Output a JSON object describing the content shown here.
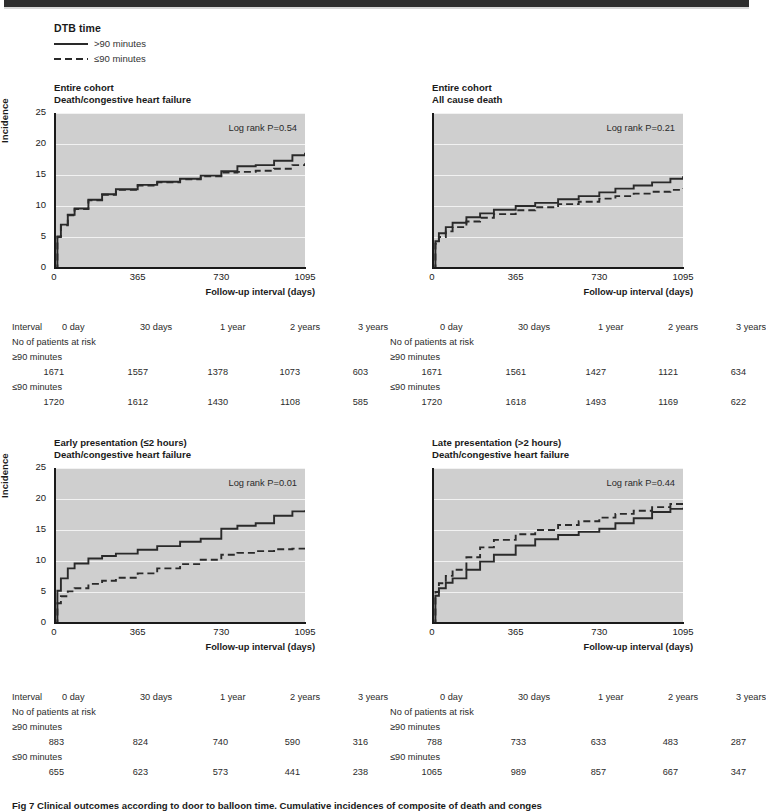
{
  "legend": {
    "title": "DTB time",
    "items": [
      {
        "label": ">90 minutes",
        "style": "solid"
      },
      {
        "label": "≤90 minutes",
        "style": "dashed"
      }
    ]
  },
  "axis": {
    "ylabel": "Incidence",
    "xtitle": "Follow-up interval (days)",
    "yticks": [
      "0",
      "5",
      "10",
      "15",
      "20",
      "25"
    ],
    "xticks": [
      "0",
      "365",
      "730",
      "1095"
    ]
  },
  "risk_table": {
    "interval_label": "Interval",
    "at_risk_label": "No of patients at risk",
    "columns": [
      "0 day",
      "30 days",
      "1 year",
      "2 years",
      "3 years"
    ],
    "group_labels": [
      "≥90 minutes",
      "≤90 minutes"
    ]
  },
  "caption": "Fig 7 Clinical outcomes according to door to balloon time. Cumulative incidences of composite of death and conges",
  "panels": [
    {
      "id": "entire-cohort-death-chf",
      "title_line1": "Entire cohort",
      "title_line2": "Death/congestive heart failure",
      "pvalue": "Log rank P=0.54",
      "show_y_labels": true,
      "rows": [
        {
          "group": "≥90 minutes",
          "values": [
            "1671",
            "1557",
            "1378",
            "1073",
            "603"
          ]
        },
        {
          "group": "≤90 minutes",
          "values": [
            "1720",
            "1612",
            "1430",
            "1108",
            "585"
          ]
        }
      ]
    },
    {
      "id": "entire-cohort-all-cause-death",
      "title_line1": "Entire cohort",
      "title_line2": "All cause death",
      "pvalue": "Log rank P=0.21",
      "show_y_labels": false,
      "rows": [
        {
          "group": "≥90 minutes",
          "values": [
            "1671",
            "1561",
            "1427",
            "1121",
            "634"
          ]
        },
        {
          "group": "≤90 minutes",
          "values": [
            "1720",
            "1618",
            "1493",
            "1169",
            "622"
          ]
        }
      ]
    },
    {
      "id": "early-presentation-death-chf",
      "title_line1": "Early presentation (≤2 hours)",
      "title_line2": "Death/congestive heart failure",
      "pvalue": "Log rank P=0.01",
      "show_y_labels": true,
      "rows": [
        {
          "group": "≥90 minutes",
          "values": [
            "883",
            "824",
            "740",
            "590",
            "316"
          ]
        },
        {
          "group": "≤90 minutes",
          "values": [
            "655",
            "623",
            "573",
            "441",
            "238"
          ]
        }
      ]
    },
    {
      "id": "late-presentation-death-chf",
      "title_line1": "Late presentation (>2 hours)",
      "title_line2": "Death/congestive heart failure",
      "pvalue": "Log rank P=0.44",
      "show_y_labels": false,
      "rows": [
        {
          "group": "≥90 minutes",
          "values": [
            "788",
            "733",
            "633",
            "483",
            "287"
          ]
        },
        {
          "group": "≤90 minutes",
          "values": [
            "1065",
            "989",
            "857",
            "667",
            "347"
          ]
        }
      ]
    }
  ],
  "chart_data": [
    {
      "type": "line",
      "title": "Entire cohort — Death/congestive heart failure",
      "xlabel": "Follow-up interval (days)",
      "ylabel": "Incidence",
      "xlim": [
        0,
        1095
      ],
      "ylim": [
        0,
        25
      ],
      "xticks": [
        0,
        365,
        730,
        1095
      ],
      "yticks": [
        0,
        5,
        10,
        15,
        20,
        25
      ],
      "grid": true,
      "annotation": "Log rank P=0.54",
      "series": [
        {
          "name": ">90 minutes",
          "style": "solid",
          "x": [
            0,
            15,
            30,
            60,
            90,
            150,
            210,
            270,
            365,
            450,
            550,
            640,
            730,
            800,
            880,
            960,
            1040,
            1095
          ],
          "y": [
            0,
            5.1,
            7.0,
            8.6,
            9.6,
            11.0,
            11.9,
            12.7,
            13.4,
            13.9,
            14.4,
            14.9,
            15.6,
            16.4,
            16.6,
            17.3,
            18.2,
            18.6
          ]
        },
        {
          "name": "≤90 minutes",
          "style": "dashed",
          "x": [
            0,
            15,
            30,
            60,
            90,
            150,
            210,
            270,
            365,
            450,
            550,
            640,
            730,
            800,
            880,
            960,
            1040,
            1095
          ],
          "y": [
            0,
            5.0,
            6.9,
            8.5,
            9.5,
            10.9,
            11.8,
            12.6,
            13.3,
            13.8,
            14.3,
            14.8,
            15.4,
            15.5,
            15.7,
            16.0,
            16.6,
            16.9
          ]
        }
      ]
    },
    {
      "type": "line",
      "title": "Entire cohort — All cause death",
      "xlabel": "Follow-up interval (days)",
      "ylabel": "Incidence",
      "xlim": [
        0,
        1095
      ],
      "ylim": [
        0,
        25
      ],
      "xticks": [
        0,
        365,
        730,
        1095
      ],
      "yticks": [
        0,
        5,
        10,
        15,
        20,
        25
      ],
      "grid": true,
      "annotation": "Log rank P=0.21",
      "series": [
        {
          "name": ">90 minutes",
          "style": "solid",
          "x": [
            0,
            15,
            30,
            60,
            90,
            150,
            210,
            270,
            365,
            450,
            550,
            640,
            730,
            800,
            880,
            960,
            1040,
            1095
          ],
          "y": [
            0,
            4.3,
            5.6,
            6.6,
            7.3,
            8.2,
            8.8,
            9.4,
            10.0,
            10.5,
            11.1,
            11.6,
            12.2,
            12.8,
            13.3,
            13.8,
            14.4,
            14.8
          ]
        },
        {
          "name": "≤90 minutes",
          "style": "dashed",
          "x": [
            0,
            15,
            30,
            60,
            90,
            150,
            210,
            270,
            365,
            450,
            550,
            640,
            730,
            800,
            880,
            960,
            1040,
            1095
          ],
          "y": [
            0,
            3.9,
            5.0,
            5.9,
            6.6,
            7.5,
            8.1,
            8.7,
            9.3,
            9.8,
            10.3,
            10.7,
            11.2,
            11.6,
            12.0,
            12.3,
            12.6,
            12.8
          ]
        }
      ]
    },
    {
      "type": "line",
      "title": "Early presentation (≤2 hours) — Death/congestive heart failure",
      "xlabel": "Follow-up interval (days)",
      "ylabel": "Incidence",
      "xlim": [
        0,
        1095
      ],
      "ylim": [
        0,
        25
      ],
      "xticks": [
        0,
        365,
        730,
        1095
      ],
      "yticks": [
        0,
        5,
        10,
        15,
        20,
        25
      ],
      "grid": true,
      "annotation": "Log rank P=0.01",
      "series": [
        {
          "name": ">90 minutes",
          "style": "solid",
          "x": [
            0,
            15,
            30,
            60,
            90,
            150,
            210,
            270,
            365,
            450,
            550,
            640,
            730,
            800,
            880,
            960,
            1040,
            1095
          ],
          "y": [
            0,
            5.2,
            7.2,
            8.8,
            9.6,
            10.4,
            10.8,
            11.2,
            11.8,
            12.4,
            13.1,
            13.6,
            15.2,
            15.7,
            16.1,
            17.3,
            18.0,
            18.2
          ]
        },
        {
          "name": "≤90 minutes",
          "style": "dashed",
          "x": [
            0,
            15,
            30,
            60,
            90,
            150,
            210,
            270,
            365,
            450,
            550,
            640,
            730,
            800,
            880,
            960,
            1040,
            1095
          ],
          "y": [
            0,
            3.2,
            4.3,
            5.1,
            5.6,
            6.3,
            6.8,
            7.3,
            8.0,
            8.8,
            9.5,
            10.2,
            11.0,
            11.3,
            11.6,
            11.9,
            12.0,
            12.1
          ]
        }
      ]
    },
    {
      "type": "line",
      "title": "Late presentation (>2 hours) — Death/congestive heart failure",
      "xlabel": "Follow-up interval (days)",
      "ylabel": "Incidence",
      "xlim": [
        0,
        1095
      ],
      "ylim": [
        0,
        25
      ],
      "xticks": [
        0,
        365,
        730,
        1095
      ],
      "yticks": [
        0,
        5,
        10,
        15,
        20,
        25
      ],
      "grid": true,
      "annotation": "Log rank P=0.44",
      "series": [
        {
          "name": ">90 minutes",
          "style": "solid",
          "x": [
            0,
            15,
            30,
            60,
            90,
            150,
            210,
            270,
            365,
            450,
            550,
            640,
            730,
            800,
            880,
            960,
            1040,
            1095
          ],
          "y": [
            0,
            4.4,
            5.6,
            6.5,
            7.2,
            8.6,
            9.9,
            11.0,
            12.5,
            13.5,
            14.2,
            14.7,
            15.2,
            16.1,
            16.9,
            17.9,
            18.4,
            18.6
          ]
        },
        {
          "name": "≤90 minutes",
          "style": "dashed",
          "x": [
            0,
            15,
            30,
            60,
            90,
            150,
            210,
            270,
            365,
            450,
            550,
            640,
            730,
            800,
            880,
            960,
            1040,
            1095
          ],
          "y": [
            0,
            5.0,
            6.4,
            7.6,
            8.6,
            10.6,
            12.2,
            13.4,
            14.3,
            15.0,
            15.8,
            16.4,
            17.0,
            17.6,
            18.1,
            18.7,
            19.2,
            19.5
          ]
        }
      ]
    }
  ]
}
